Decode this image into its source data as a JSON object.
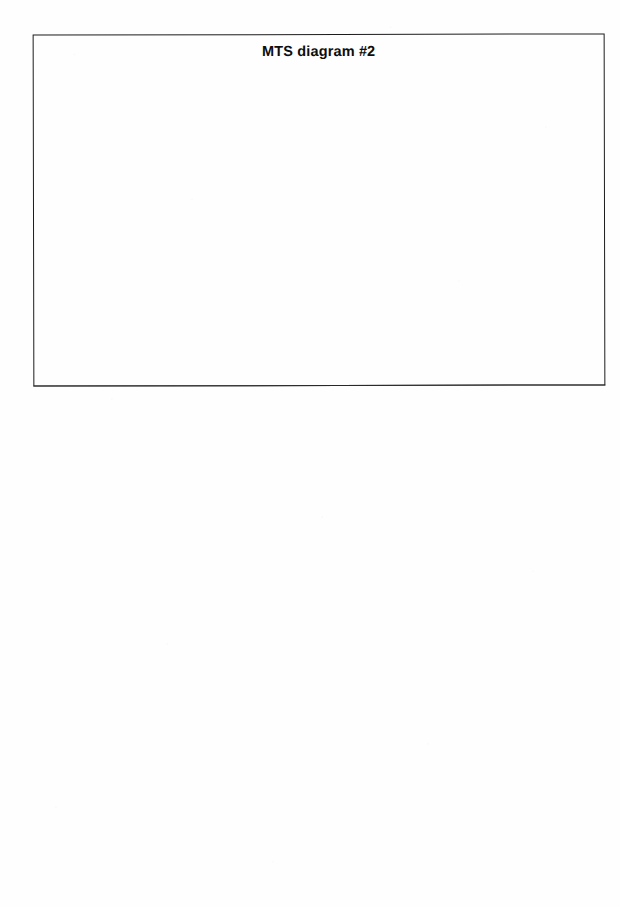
{
  "page": {
    "background_color": "#fefefe",
    "width": 620,
    "height": 907,
    "body_text": ""
  },
  "diagram": {
    "title": "MTS diagram #2",
    "border_color": "#1c1c1c",
    "fill_color": "#ffffff",
    "canvas_text": "",
    "frame": {
      "x": 33,
      "y": 34,
      "width": 572,
      "height": 352
    }
  }
}
